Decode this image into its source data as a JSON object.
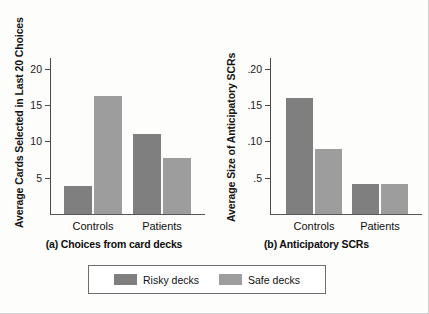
{
  "chart_data": [
    {
      "type": "bar",
      "panel_id": "a",
      "title": "(a) Choices from card decks",
      "xlabel": "",
      "ylabel": "Average Cards Selected in Last 20 Choices",
      "categories": [
        "Controls",
        "Patients"
      ],
      "series": [
        {
          "name": "Risky decks",
          "values": [
            3.8,
            11.0
          ],
          "color": "#7f7f7f"
        },
        {
          "name": "Safe decks",
          "values": [
            16.2,
            7.7
          ],
          "color": "#9d9d9d"
        }
      ],
      "ylim": [
        0,
        21.5
      ],
      "yticks": [
        5,
        10,
        15,
        20
      ],
      "ytick_labels": [
        "5",
        "10",
        "15",
        "20"
      ],
      "grid": false,
      "legend_position": "bottom"
    },
    {
      "type": "bar",
      "panel_id": "b",
      "title": "(b) Anticipatory SCRs",
      "xlabel": "",
      "ylabel": "Average Size of Anticipatory SCRs",
      "categories": [
        "Controls",
        "Patients"
      ],
      "series": [
        {
          "name": "Risky decks",
          "values": [
            0.16,
            0.042
          ],
          "color": "#7f7f7f"
        },
        {
          "name": "Safe decks",
          "values": [
            0.089,
            0.041
          ],
          "color": "#9d9d9d"
        }
      ],
      "ylim": [
        0,
        0.215
      ],
      "yticks": [
        0.05,
        0.1,
        0.15,
        0.2
      ],
      "ytick_labels": [
        ".5",
        ".10",
        ".15",
        ".20"
      ],
      "grid": false,
      "legend_position": "bottom"
    }
  ],
  "panel_a": {
    "axis_title": "Average Cards Selected in Last 20 Choices",
    "caption": "(a) Choices from card decks",
    "ytick_labels": [
      ".5_unused",
      "5",
      "10",
      "15",
      "20"
    ],
    "ticks": [
      {
        "label": "20"
      },
      {
        "label": "15"
      },
      {
        "label": "10"
      },
      {
        "label": "5"
      }
    ],
    "groups": [
      {
        "label": "Controls"
      },
      {
        "label": "Patients"
      }
    ]
  },
  "panel_b": {
    "axis_title": "Average Size of Anticipatory SCRs",
    "caption": "(b) Anticipatory SCRs",
    "ticks": [
      {
        "label": ".20"
      },
      {
        "label": ".15"
      },
      {
        "label": ".10"
      },
      {
        "label": ".5"
      }
    ],
    "groups": [
      {
        "label": "Controls"
      },
      {
        "label": "Patients"
      }
    ]
  },
  "legend": {
    "entries": [
      {
        "label": "Risky decks",
        "color": "#7f7f7f"
      },
      {
        "label": "Safe decks",
        "color": "#9d9d9d"
      }
    ]
  },
  "colors": {
    "risky": "#7f7f7f",
    "safe": "#9d9d9d",
    "axis": "#4a4a4a",
    "text": "#111111",
    "background": "#fdfdfc"
  }
}
